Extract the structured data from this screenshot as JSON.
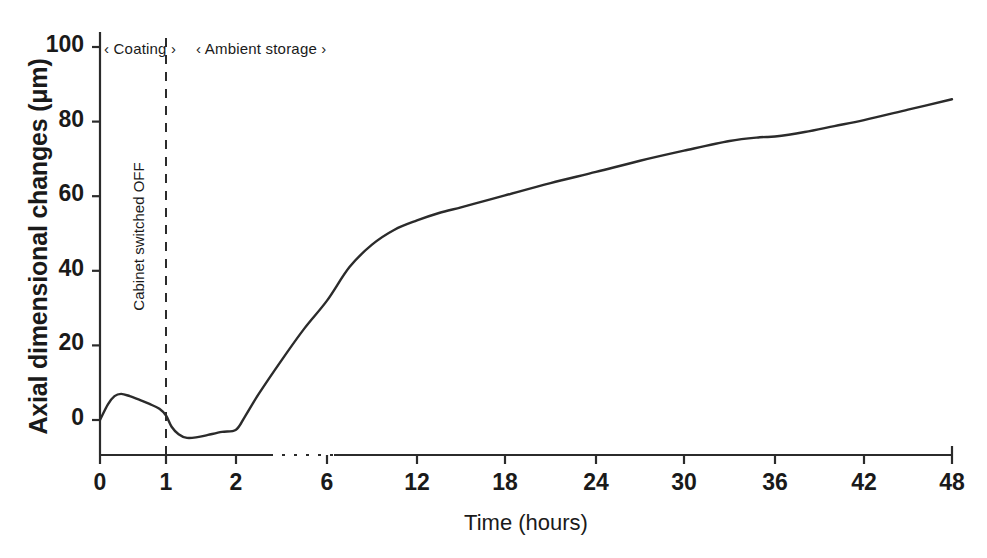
{
  "chart_data": {
    "type": "line",
    "title": "",
    "subtitle": "",
    "xlabel": "Time (hours)",
    "ylabel": "Axial dimensional changes (μm)",
    "xlim": [
      0,
      48
    ],
    "ylim": [
      -12,
      104
    ],
    "grid": false,
    "legend": null,
    "x_axis_broken": true,
    "x_break_between": [
      2,
      6
    ],
    "xticks": [
      0,
      1,
      2,
      6,
      12,
      18,
      24,
      30,
      36,
      42,
      48
    ],
    "xtick_labels": [
      "0",
      "1",
      "2",
      "6",
      "12",
      "18",
      "24",
      "30",
      "36",
      "42",
      "48"
    ],
    "yticks": [
      0,
      20,
      40,
      60,
      80,
      100
    ],
    "ytick_labels": [
      "0",
      "20",
      "40",
      "60",
      "80",
      "100"
    ],
    "series": [
      {
        "name": "Axial dimensional change",
        "color": "#2b2b2b",
        "x": [
          0,
          0.12,
          0.22,
          0.32,
          0.45,
          0.6,
          0.75,
          0.9,
          1.0,
          1.08,
          1.18,
          1.3,
          1.45,
          1.6,
          1.8,
          2.0,
          2.4,
          3.0,
          4.0,
          5.0,
          6.0,
          7.5,
          9.0,
          10.5,
          12.0,
          13.5,
          15.0,
          16.5,
          18.0,
          21.0,
          24.0,
          27.0,
          30.0,
          33.0,
          35.0,
          36.0,
          38.0,
          40.0,
          42.0,
          45.0,
          48.0
        ],
        "y": [
          0.0,
          4.2,
          6.4,
          7.0,
          6.4,
          5.4,
          4.3,
          3.0,
          1.2,
          -1.8,
          -3.8,
          -4.8,
          -4.6,
          -4.0,
          -3.2,
          -2.6,
          1.0,
          7.0,
          16.0,
          24.5,
          32.0,
          41.0,
          47.0,
          51.0,
          53.5,
          55.5,
          57.0,
          58.6,
          60.2,
          63.5,
          66.5,
          69.5,
          72.2,
          74.8,
          75.8,
          76.0,
          77.2,
          78.8,
          80.4,
          83.2,
          86.0
        ]
      }
    ],
    "annotations": [
      {
        "name": "phase-coating",
        "text": "‹ Coating ›",
        "x_range": [
          0,
          1
        ]
      },
      {
        "name": "phase-ambient",
        "text": "‹  Ambient storage        ›",
        "x_range": [
          1,
          48
        ]
      },
      {
        "name": "cabinet-switched-off-line",
        "text": "Cabinet switched OFF",
        "x": 1,
        "style": "dashed-vertical"
      }
    ]
  },
  "axes": {
    "y_title": "Axial dimensional changes (μm)",
    "x_title": "Time (hours)"
  },
  "phases": {
    "coating": "‹ Coating ›",
    "ambient": "‹  Ambient storage        ›"
  },
  "vline": {
    "label": "Cabinet switched OFF"
  },
  "colors": {
    "curve": "#2b2b2b",
    "axis": "#2b2b2b",
    "text": "#1a1a1a",
    "background": "#ffffff"
  }
}
